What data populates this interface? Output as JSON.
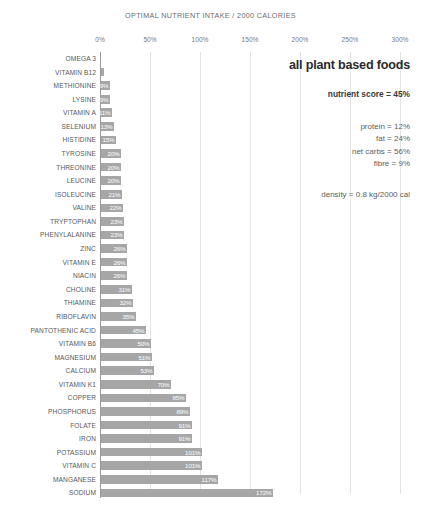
{
  "chart_data": {
    "type": "bar",
    "orientation": "horizontal",
    "title": "OPTIMAL NUTRIENT INTAKE / 2000 CALORIES",
    "xlabel": "",
    "ylabel": "",
    "xlim": [
      0,
      300
    ],
    "xticks": [
      "0%",
      "50%",
      "100%",
      "150%",
      "200%",
      "250%",
      "300%"
    ],
    "xtick_values": [
      0,
      50,
      100,
      150,
      200,
      250,
      300
    ],
    "grid": true,
    "legend": "none",
    "bar_color": "#a6a6a6",
    "categories": [
      "OMEGA 3",
      "VITAMIN B12",
      "METHIONINE",
      "LYSINE",
      "VITAMIN A",
      "SELENIUM",
      "HISTIDINE",
      "TYROSINE",
      "THREONINE",
      "LEUCINE",
      "ISOLEUCINE",
      "VALINE",
      "TRYPTOPHAN",
      "PHENYLALANINE",
      "ZINC",
      "VITAMIN E",
      "NIACIN",
      "CHOLINE",
      "THIAMINE",
      "RIBOFLAVIN",
      "PANTOTHENIC ACID",
      "VITAMIN B6",
      "MAGNESIUM",
      "CALCIUM",
      "VITAMIN K1",
      "COPPER",
      "PHOSPHORUS",
      "FOLATE",
      "IRON",
      "POTASSIUM",
      "VITAMIN C",
      "MANGANESE",
      "SODIUM"
    ],
    "values": [
      0,
      3,
      9,
      9,
      11,
      13,
      15,
      20,
      20,
      20,
      21,
      22,
      23,
      23,
      26,
      26,
      26,
      31,
      32,
      35,
      45,
      50,
      51,
      53,
      70,
      85,
      89,
      91,
      91,
      101,
      101,
      117,
      172
    ],
    "value_labels": [
      "0%",
      "3%",
      "9%",
      "9%",
      "11%",
      "13%",
      "15%",
      "20%",
      "20%",
      "20%",
      "21%",
      "22%",
      "23%",
      "23%",
      "26%",
      "26%",
      "26%",
      "31%",
      "32%",
      "35%",
      "45%",
      "50%",
      "51%",
      "53%",
      "70%",
      "85%",
      "89%",
      "91%",
      "91%",
      "101%",
      "101%",
      "117%",
      "172%"
    ]
  },
  "info_panel": {
    "headline": "all plant based foods",
    "nutrient_score": "nutrient score = 45%",
    "macros": [
      "protein = 12%",
      "fat = 24%",
      "net carbs = 56%",
      "fibre = 9%"
    ],
    "density": "density = 0.8 kg/2000 cal"
  }
}
